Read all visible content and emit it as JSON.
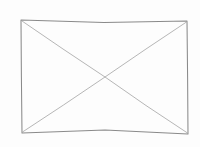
{
  "canvas": {
    "width": 200,
    "height": 147,
    "background_color": "#fdfdfd",
    "title": "Image placeholder sketch"
  },
  "figure": {
    "kind": "rectangle-with-crossed-diagonals",
    "stroke_color_border": "#8a8a8a",
    "stroke_color_diagonal": "#a9a9a9",
    "stroke_width_border": 1.05,
    "stroke_width_diagonal": 0.85,
    "corners": {
      "top_left": {
        "x": 21,
        "y": 20
      },
      "top_right": {
        "x": 187,
        "y": 21
      },
      "bottom_right": {
        "x": 188,
        "y": 134
      },
      "bottom_left": {
        "x": 22,
        "y": 133
      }
    },
    "crossing_point": {
      "x": 105,
      "y": 77
    },
    "border_path": "M 21 20 L 104 22.5 L 187 21 L 187.6 77 L 188 134 L 105 130 L 22 133 L 21.4 77 Z",
    "diagonal_tl_br_path": "M 22 21 L 63 49 L 105 77 L 146 105.5 L 187.5 133",
    "diagonal_tr_bl_path": "M 186.5 22 L 146 49 L 105 77 L 63.5 105 L 22.5 132"
  }
}
